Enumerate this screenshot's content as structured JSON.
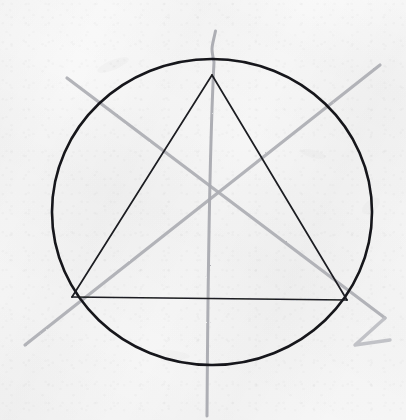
{
  "canvas": {
    "width": 406,
    "height": 420,
    "background_color": "#f6f6f6",
    "medium": "pencil-on-paper",
    "title": "Hand-drawn circle with inscribed triangle and construction lines"
  },
  "palette": {
    "paper": "#f6f6f6",
    "ink_dark": "#15161a",
    "pencil_gray": "#a9aab0",
    "pencil_gray_light": "#bcbdc2"
  },
  "figure": {
    "circle": {
      "label": "circumscribed-circle",
      "center_x": 212,
      "center_y": 212,
      "radius_x": 160,
      "radius_y": 153,
      "stroke_color": "#15161a",
      "stroke_width": 2.6
    },
    "triangle": {
      "label": "inscribed-triangle",
      "stroke_color": "#1b1c20",
      "stroke_width": 1.7,
      "vertices": [
        {
          "name": "apex",
          "x": 212,
          "y": 75
        },
        {
          "name": "bottom-left",
          "x": 72,
          "y": 297
        },
        {
          "name": "bottom-right",
          "x": 347,
          "y": 300
        }
      ],
      "sides": [
        {
          "name": "left-side",
          "x1": 212,
          "y1": 75,
          "x2": 72,
          "y2": 297
        },
        {
          "name": "right-side",
          "x1": 212,
          "y1": 75,
          "x2": 347,
          "y2": 300
        },
        {
          "name": "base",
          "x1": 72,
          "y1": 297,
          "x2": 347,
          "y2": 300
        }
      ]
    },
    "construction_lines": [
      {
        "name": "vertical-median",
        "stroke_color": "#a9aab0",
        "stroke_width": 3.0,
        "x1": 215,
        "y1": 30,
        "x2": 207,
        "y2": 416
      },
      {
        "name": "diagonal-descending",
        "stroke_color": "#adaeb4",
        "stroke_width": 3.2,
        "x1": 67,
        "y1": 78,
        "x2": 385,
        "y2": 318
      },
      {
        "name": "diagonal-ascending",
        "stroke_color": "#adaeb4",
        "stroke_width": 3.2,
        "x1": 25,
        "y1": 345,
        "x2": 380,
        "y2": 65
      }
    ],
    "stray_marks": [
      {
        "name": "chevron-mark-lower-right",
        "stroke_color": "#bcbdc2",
        "stroke_width": 3.4,
        "points": "385,318 355,345 390,340"
      },
      {
        "name": "hook-mark-top",
        "stroke_color": "#b4b5ba",
        "stroke_width": 2.6,
        "points": "216,30 210,46 216,58"
      }
    ],
    "intersection": {
      "name": "construction-crossing-point",
      "x": 205,
      "y": 197
    }
  }
}
